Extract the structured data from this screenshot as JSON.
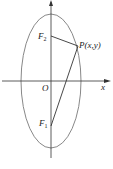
{
  "diagram": {
    "type": "ellipse-foci",
    "labels": {
      "origin": "O",
      "x_axis": "x",
      "focus_upper": "F",
      "focus_upper_sub": "2",
      "focus_lower": "F",
      "focus_lower_sub": "1",
      "point": "P(x,y)"
    },
    "colors": {
      "ellipse": "#888888",
      "axes": "#333333",
      "segments": "#333333"
    }
  }
}
